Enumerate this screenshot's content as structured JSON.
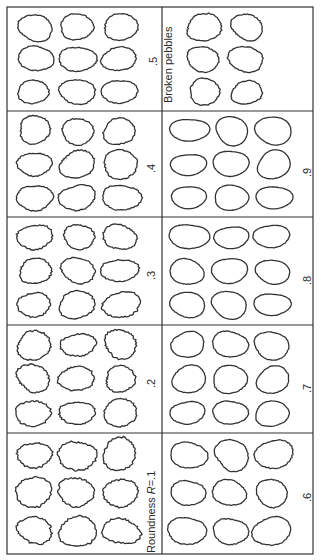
{
  "figure": {
    "orientation": "rotated 90° counter-clockwise",
    "grid": {
      "columns": 2,
      "rows": 5
    },
    "cells": [
      {
        "id": "r01",
        "label": ".1",
        "label_text": "Roundness R=.1",
        "prefix": "Roundness ",
        "var": "R",
        "suffix": "=.1",
        "col": 0,
        "row": 4,
        "texture": "very angular"
      },
      {
        "id": "r02",
        "label": ".2",
        "label_text": ".2",
        "col": 0,
        "row": 3,
        "texture": "angular"
      },
      {
        "id": "r03",
        "label": ".3",
        "label_text": ".3",
        "col": 0,
        "row": 2,
        "texture": "subangular"
      },
      {
        "id": "r04",
        "label": ".4",
        "label_text": ".4",
        "col": 0,
        "row": 1,
        "texture": "subangular-subrounded"
      },
      {
        "id": "r05",
        "label": ".5",
        "label_text": ".5",
        "col": 0,
        "row": 0,
        "texture": "subrounded"
      },
      {
        "id": "r06",
        "label": ".6",
        "label_text": ".6",
        "col": 1,
        "row": 4,
        "texture": "rounded"
      },
      {
        "id": "r07",
        "label": ".7",
        "label_text": ".7",
        "col": 1,
        "row": 3,
        "texture": "rounded"
      },
      {
        "id": "r08",
        "label": ".8",
        "label_text": ".8",
        "col": 1,
        "row": 2,
        "texture": "well rounded"
      },
      {
        "id": "r09",
        "label": ".9",
        "label_text": ".9",
        "col": 1,
        "row": 1,
        "texture": "well rounded"
      },
      {
        "id": "broken",
        "label": "Broken pebbles",
        "label_text": "Broken pebbles",
        "col": 1,
        "row": 0,
        "texture": "broken"
      }
    ],
    "pebbles_per_cell": 9,
    "broken_pebbles_count": 6,
    "colors": {
      "line": "#333333",
      "background": "#ffffff"
    }
  }
}
